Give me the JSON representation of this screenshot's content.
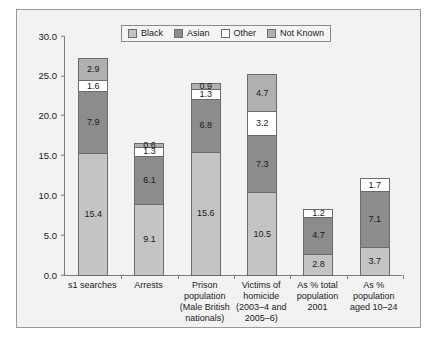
{
  "chart_data": {
    "type": "bar",
    "subtype": "stacked-vertical",
    "title": "",
    "subtitle": "",
    "xlabel": "",
    "ylabel": "",
    "ylim": [
      0.0,
      30.0
    ],
    "ytick_labels": [
      "0.0",
      "5.0",
      "10.0",
      "15.0",
      "20.0",
      "25.0",
      "30.0"
    ],
    "ytick_values": [
      0.0,
      5.0,
      10.0,
      15.0,
      20.0,
      25.0,
      30.0
    ],
    "grid": false,
    "legend_position": "top-center",
    "categories": [
      "s1 searches",
      "Arrests",
      "Prison population (Male British nationals)",
      "Victims of homicide (2003–4 and 2005–6)",
      "As % total population 2001",
      "As % population aged 10–24"
    ],
    "category_lines": [
      [
        "s1 searches"
      ],
      [
        "Arrests"
      ],
      [
        "Prison",
        "population",
        "(Male British",
        "nationals)"
      ],
      [
        "Victims of",
        "homicide",
        "(2003–4 and",
        "2005–6)"
      ],
      [
        "As % total",
        "population",
        "2001"
      ],
      [
        "As %",
        "population",
        "aged 10–24"
      ]
    ],
    "series": [
      {
        "name": "Black",
        "color": "#c4c4c4",
        "values": [
          15.4,
          9.1,
          15.6,
          10.5,
          2.8,
          3.7
        ]
      },
      {
        "name": "Asian",
        "color": "#8c8c8c",
        "values": [
          7.9,
          6.1,
          6.8,
          7.3,
          4.7,
          7.1
        ]
      },
      {
        "name": "Other",
        "color": "#ffffff",
        "values": [
          1.6,
          1.3,
          1.3,
          3.2,
          1.2,
          1.7
        ]
      },
      {
        "name": "Not Known",
        "color": "#b0b0b0",
        "values": [
          2.9,
          0.6,
          0.9,
          4.7,
          null,
          null
        ]
      }
    ],
    "totals": [
      27.8,
      17.1,
      24.6,
      25.7,
      8.7,
      12.5
    ],
    "data_labels": [
      [
        "15.4",
        "7.9",
        "1.6",
        "2.9"
      ],
      [
        "9.1",
        "6.1",
        "1.3",
        "0.6"
      ],
      [
        "15.6",
        "6.8",
        "1.3",
        "0.9"
      ],
      [
        "10.5",
        "7.3",
        "3.2",
        "4.7"
      ],
      [
        "2.8",
        "4.7",
        "1.2",
        ""
      ],
      [
        "3.7",
        "7.1",
        "1.7",
        ""
      ]
    ]
  },
  "legend": {
    "items": [
      {
        "label": "Black"
      },
      {
        "label": "Asian"
      },
      {
        "label": "Other"
      },
      {
        "label": "Not Known"
      }
    ]
  },
  "colors": {
    "panel_background": "#f2f2f2",
    "page_background": "#ffffff",
    "axis": "#7c7c7c",
    "border": "#9a9a9a",
    "text": "#1a1a1a"
  }
}
